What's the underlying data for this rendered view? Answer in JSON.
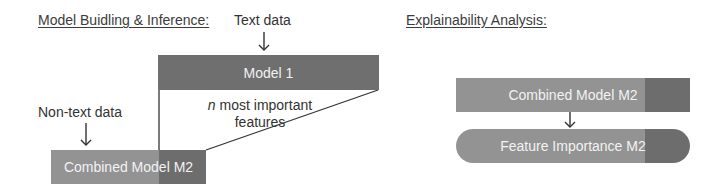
{
  "left_section": {
    "heading": "Model Buidling & Inference:",
    "text_input_label": "Text data",
    "non_text_input_label": "Non-text data",
    "model1_label": "Model 1",
    "connector_label_italic": "n",
    "connector_label_rest": " most important",
    "connector_label_line2": "features",
    "combined_model_label": "Combined Model M2"
  },
  "right_section": {
    "heading": "Explainability Analysis:",
    "combined_model_label": "Combined Model M2",
    "feature_importance_label": "Feature Importance M2"
  },
  "colors": {
    "model1_fill": "#6f6f6f",
    "light_fill": "#939393",
    "dark_fill": "#6d6d6d",
    "line": "#333333",
    "box_text": "#f2f2f2"
  }
}
